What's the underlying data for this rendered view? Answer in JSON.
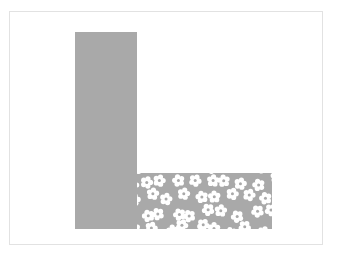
{
  "image": {
    "kind": "abstract-shape-illustration",
    "width": 337,
    "height": 257,
    "background_color": "#ffffff",
    "description": "An L-shaped figure: a tall solid gray vertical bar whose bottom joins a shorter horizontal bar that is filled with a white five-petal flower pattern on the same gray."
  },
  "frame": {
    "name": "image-border",
    "color": "#e2e2e2",
    "thickness_px": 1,
    "left": 9,
    "top": 11,
    "width": 314,
    "height": 234
  },
  "figure": {
    "name": "l-shape",
    "fill_color": "#a9a9a9",
    "pattern_color": "#ffffff",
    "stem": {
      "name": "vertical-bar",
      "fill": "solid",
      "left": 65,
      "top": 20,
      "width": 62,
      "height": 197
    },
    "foot": {
      "name": "horizontal-bar",
      "fill": "flower-pattern",
      "left": 127,
      "top": 161,
      "width": 135,
      "height": 56,
      "pattern": {
        "motif": "five-petal-flower",
        "petal_count": 5,
        "flower_diameter_px": 13,
        "tile_size_px": 16,
        "flower_fill": "#ffffff",
        "center_fill": "#a9a9a9",
        "center_diameter_px": 3
      }
    }
  }
}
